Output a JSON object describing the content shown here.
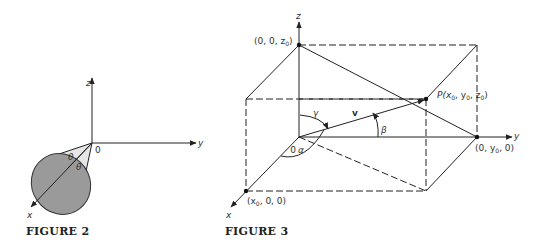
{
  "figure2": {
    "caption": "FIGURE 2",
    "axes": {
      "x": "x",
      "y": "y",
      "z": "z"
    },
    "origin_label": "0",
    "angle_labels": [
      "θ",
      "θ"
    ],
    "colors": {
      "cone_side": "#e6e6e6",
      "cone_base": "#9a9a9a",
      "stroke": "#222222"
    }
  },
  "figure3": {
    "caption": "FIGURE 3",
    "axes": {
      "x": "x",
      "y": "y",
      "z": "z"
    },
    "origin_label": "0",
    "vector_label": "v",
    "angles": {
      "alpha": "α",
      "beta": "β",
      "gamma": "γ"
    },
    "points": {
      "z_point": "(0, 0, z",
      "z_sub": "0",
      "y_point_pre": "(0, y",
      "y_point_sub": "0",
      "y_point_post": ", 0)",
      "x_point_pre": "(x",
      "x_point_sub": "0",
      "x_point_post": ", 0, 0)",
      "p_pre": "P(x",
      "p_sub1": "0",
      "p_mid1": ", y",
      "p_sub2": "0",
      "p_mid2": ", z",
      "p_sub3": "0",
      "p_post": ")"
    }
  }
}
